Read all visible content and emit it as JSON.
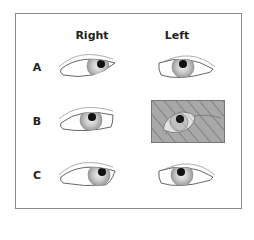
{
  "figure": {
    "columns": [
      {
        "label": "Right"
      },
      {
        "label": "Left"
      }
    ],
    "rows": [
      {
        "label": "A",
        "right": {
          "gaze": "outward-right",
          "obscured": false
        },
        "left": {
          "gaze": "center",
          "obscured": false
        }
      },
      {
        "label": "B",
        "right": {
          "gaze": "center",
          "obscured": false
        },
        "left": {
          "gaze": "inward",
          "obscured": true
        }
      },
      {
        "label": "C",
        "right": {
          "gaze": "outward-right",
          "obscured": false
        },
        "left": {
          "gaze": "center",
          "obscured": false
        }
      }
    ],
    "colors": {
      "frame": "#8a8a8a",
      "iris": "#b5b5b5",
      "pupil": "#111111",
      "cover": "#a8a8a8",
      "hatch": "#6f6f6f"
    }
  }
}
